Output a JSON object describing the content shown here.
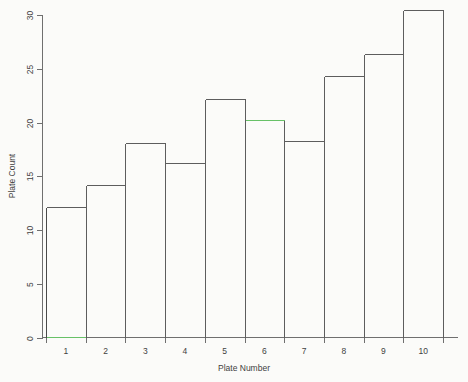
{
  "chart_data": {
    "type": "bar",
    "title": "",
    "xlabel": "Plate Number",
    "ylabel": "Plate Count",
    "categories": [
      "1",
      "2",
      "3",
      "4",
      "5",
      "6",
      "7",
      "8",
      "9",
      "10"
    ],
    "values": [
      12.1,
      14.2,
      18.1,
      16.2,
      22.2,
      20.2,
      18.3,
      24.3,
      26.4,
      30.5
    ],
    "ylim": [
      0,
      30
    ],
    "xlim": [
      0.5,
      10.5
    ],
    "yticks": [
      0,
      5,
      10,
      15,
      20,
      25,
      30
    ],
    "ytick_labels": [
      "0",
      "5",
      "10",
      "15",
      "20",
      "25",
      "30"
    ],
    "xtick_labels": [
      "1",
      "2",
      "3",
      "4",
      "5",
      "6",
      "7",
      "8",
      "9",
      "10"
    ],
    "grid": false,
    "legend": "none",
    "bar_style": "outline-only",
    "colors": {
      "background": "#fbfbf9",
      "bar_outline": "#5d5d5d",
      "axis": "#6f6f6f",
      "accent_green": "#67c167",
      "text": "#3f3f3f"
    },
    "annotations": {
      "green_bar_top_index": 5,
      "green_baseline_index": 0,
      "note": "Bar 6 top edge and bar 1 baseline drawn in green; bar 1 left edge drawn darker."
    }
  }
}
